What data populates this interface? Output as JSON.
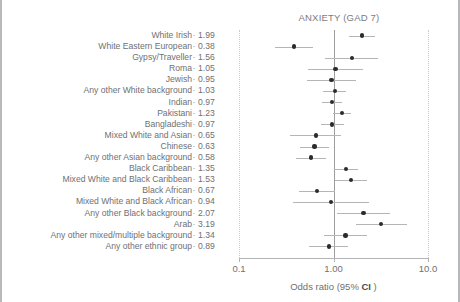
{
  "chart_data": {
    "type": "scatter",
    "subtype": "forest-plot",
    "title": "ANXIETY (GAD 7)",
    "xlabel": "Odds ratio (95% CI )",
    "ylabel": "",
    "xscale": "log",
    "xlim": [
      0.1,
      10.0
    ],
    "xticks": [
      0.1,
      1.0,
      10.0
    ],
    "xticklabels": [
      "0.1",
      "1.00",
      "10.0"
    ],
    "reference_line": 1.0,
    "grid": "vertical-dotted-at-xlims",
    "legend": "none",
    "value_column_header": "",
    "categories": [
      "White Irish",
      "White Eastern European",
      "Gypsy/Traveller",
      "Roma",
      "Jewish",
      "Any other White background",
      "Indian",
      "Pakistani",
      "Bangladeshi",
      "Mixed White and Asian",
      "Chinese",
      "Any other Asian background",
      "Black Caribbean",
      "Mixed White and Black Caribbean",
      "Black African",
      "Mixed White and Black African",
      "Any other Black background",
      "Arab",
      "Any other mixed/multiple background",
      "Any other ethnic group"
    ],
    "values": [
      1.99,
      0.38,
      1.56,
      1.05,
      0.95,
      1.03,
      0.97,
      1.23,
      0.97,
      0.65,
      0.63,
      0.58,
      1.35,
      1.53,
      0.67,
      0.94,
      2.07,
      3.19,
      1.34,
      0.89
    ],
    "value_labels": [
      "1.99",
      "0.38",
      "1.56",
      "1.05",
      "0.95",
      "1.03",
      "0.97",
      "1.23",
      "0.97",
      "0.65",
      "0.63",
      "0.58",
      "1.35",
      "1.53",
      "0.67",
      "0.94",
      "2.07",
      "3.19",
      "1.34",
      "0.89"
    ],
    "ci_low": [
      1.46,
      0.24,
      0.82,
      0.54,
      0.52,
      0.78,
      0.76,
      0.99,
      0.73,
      0.35,
      0.44,
      0.4,
      1.01,
      1.04,
      0.43,
      0.37,
      1.08,
      1.71,
      0.8,
      0.55
    ],
    "ci_high": [
      2.72,
      0.6,
      2.97,
      2.05,
      1.75,
      1.36,
      1.24,
      1.53,
      1.29,
      1.21,
      0.9,
      0.84,
      1.8,
      2.24,
      1.04,
      2.36,
      3.97,
      5.96,
      2.25,
      1.44
    ],
    "marker_color": "#2b2b2d",
    "ci_color": "#b4b5b7",
    "reference_line_color": "#9c9d9f",
    "gridline_color": "#c9cacc",
    "text_color": "#6f7072"
  },
  "axis": {
    "title": "Odds ratio (95% CI )",
    "title_prefix": "Odds ratio (95% ",
    "title_emphasis": "CI",
    "title_suffix": " )",
    "tick_0": "0.1",
    "tick_1": "1.00",
    "tick_2": "10.0"
  },
  "row_dash": "·",
  "header": {
    "title": "ANXIETY (GAD 7)"
  }
}
